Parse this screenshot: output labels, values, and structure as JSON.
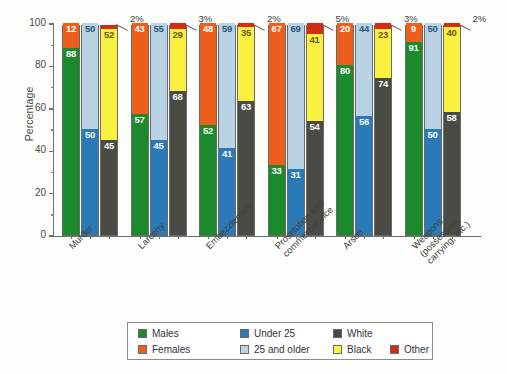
{
  "chart_data": {
    "type": "bar",
    "subtype": "grouped-stacked-100-percent",
    "title": "",
    "xlabel": "",
    "ylabel": "Percentage",
    "ylim": [
      0,
      100
    ],
    "yticks": [
      0,
      20,
      40,
      60,
      80,
      100
    ],
    "ytick_labels": [
      "0",
      "20",
      "40",
      "60",
      "80",
      "100"
    ],
    "minor_yticks": [
      10,
      30,
      50,
      70,
      90
    ],
    "grid": false,
    "legend_position": "bottom",
    "categories": [
      "Murder",
      "Larceny",
      "Embezzlement",
      "Prostitution and\ncommercial vice",
      "Arson",
      "Weapons\n(possession,\ncarrying, etc.)"
    ],
    "bar_types": [
      "sex",
      "age",
      "race"
    ],
    "series": [
      {
        "name": "Males",
        "key": "males",
        "color": "#1b8a2c",
        "label_color": "#ffffff"
      },
      {
        "name": "Females",
        "key": "females",
        "color": "#ef5f1c",
        "label_color": "#ffffff"
      },
      {
        "name": "Under 25",
        "key": "under25",
        "color": "#2a79b8",
        "label_color": "#ffffff"
      },
      {
        "name": "25 and older",
        "key": "over25",
        "color": "#b9d2e4",
        "label_color": "#2a5878"
      },
      {
        "name": "White",
        "key": "white",
        "color": "#4b4b46",
        "label_color": "#ffffff"
      },
      {
        "name": "Black",
        "key": "black",
        "color": "#faf03f",
        "label_color": "#6a5a10"
      },
      {
        "name": "Other",
        "key": "other",
        "color": "#d42c12",
        "label_color": "#ffffff"
      }
    ],
    "groups": [
      {
        "category": "Murder",
        "sex": [
          {
            "key": "males",
            "value": 88
          },
          {
            "key": "females",
            "value": 12
          }
        ],
        "age": [
          {
            "key": "under25",
            "value": 50
          },
          {
            "key": "over25",
            "value": 50
          }
        ],
        "race": [
          {
            "key": "white",
            "value": 45
          },
          {
            "key": "black",
            "value": 52
          },
          {
            "key": "other",
            "value": 2
          }
        ],
        "other_callout": "2%"
      },
      {
        "category": "Larceny",
        "sex": [
          {
            "key": "males",
            "value": 57
          },
          {
            "key": "females",
            "value": 43
          }
        ],
        "age": [
          {
            "key": "under25",
            "value": 45
          },
          {
            "key": "over25",
            "value": 55
          }
        ],
        "race": [
          {
            "key": "white",
            "value": 68
          },
          {
            "key": "black",
            "value": 29
          },
          {
            "key": "other",
            "value": 3
          }
        ],
        "other_callout": "3%"
      },
      {
        "category": "Embezzlement",
        "sex": [
          {
            "key": "males",
            "value": 52
          },
          {
            "key": "females",
            "value": 48
          }
        ],
        "age": [
          {
            "key": "under25",
            "value": 41
          },
          {
            "key": "over25",
            "value": 59
          }
        ],
        "race": [
          {
            "key": "white",
            "value": 63
          },
          {
            "key": "black",
            "value": 35
          },
          {
            "key": "other",
            "value": 2
          }
        ],
        "other_callout": "2%"
      },
      {
        "category": "Prostitution and commercial vice",
        "sex": [
          {
            "key": "males",
            "value": 33
          },
          {
            "key": "females",
            "value": 67
          }
        ],
        "age": [
          {
            "key": "under25",
            "value": 31
          },
          {
            "key": "over25",
            "value": 69
          }
        ],
        "race": [
          {
            "key": "white",
            "value": 54
          },
          {
            "key": "black",
            "value": 41
          },
          {
            "key": "other",
            "value": 5
          }
        ],
        "other_callout": "5%"
      },
      {
        "category": "Arson",
        "sex": [
          {
            "key": "males",
            "value": 80
          },
          {
            "key": "females",
            "value": 20
          }
        ],
        "age": [
          {
            "key": "under25",
            "value": 56
          },
          {
            "key": "over25",
            "value": 44
          }
        ],
        "race": [
          {
            "key": "white",
            "value": 74
          },
          {
            "key": "black",
            "value": 23
          },
          {
            "key": "other",
            "value": 3
          }
        ],
        "other_callout": "3%"
      },
      {
        "category": "Weapons (possession, carrying, etc.)",
        "sex": [
          {
            "key": "males",
            "value": 91
          },
          {
            "key": "females",
            "value": 9
          }
        ],
        "age": [
          {
            "key": "under25",
            "value": 50
          },
          {
            "key": "over25",
            "value": 50
          }
        ],
        "race": [
          {
            "key": "white",
            "value": 58
          },
          {
            "key": "black",
            "value": 40
          },
          {
            "key": "other",
            "value": 2
          }
        ],
        "other_callout": "2%"
      }
    ]
  },
  "legend": {
    "entries": [
      {
        "label": "Males",
        "key": "males",
        "col": 0,
        "row": 0
      },
      {
        "label": "Females",
        "key": "females",
        "col": 0,
        "row": 1
      },
      {
        "label": "Under 25",
        "key": "under25",
        "col": 1,
        "row": 0
      },
      {
        "label": "25 and older",
        "key": "over25",
        "col": 1,
        "row": 1
      },
      {
        "label": "White",
        "key": "white",
        "col": 2,
        "row": 0
      },
      {
        "label": "Black",
        "key": "black",
        "col": 2,
        "row": 1
      },
      {
        "label": "Other",
        "key": "other",
        "col": 3,
        "row": 1
      }
    ]
  }
}
